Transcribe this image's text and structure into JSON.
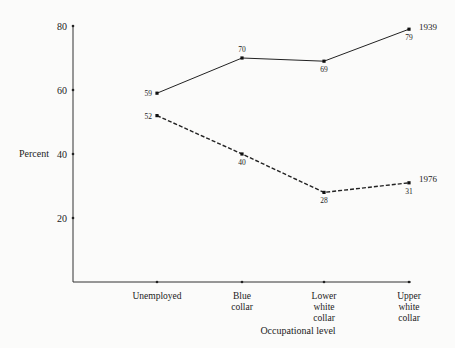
{
  "chart_data": {
    "type": "line",
    "title": "",
    "xlabel": "Occupational level",
    "ylabel": "Percent",
    "categories": [
      "Unemployed",
      "Blue collar",
      "Lower white collar",
      "Upper white collar"
    ],
    "category_lines": [
      [
        "Unemployed"
      ],
      [
        "Blue",
        "collar"
      ],
      [
        "Lower",
        "white",
        "collar"
      ],
      [
        "Upper",
        "white",
        "collar"
      ]
    ],
    "yticks": [
      20,
      40,
      60,
      80
    ],
    "ylim": [
      0,
      80
    ],
    "grid": false,
    "legend": "inline labels at line ends",
    "series": [
      {
        "name": "1939",
        "values": [
          59,
          70,
          69,
          79
        ],
        "style": "solid",
        "color": "#222222"
      },
      {
        "name": "1976",
        "values": [
          52,
          40,
          28,
          31
        ],
        "style": "dashed",
        "color": "#222222"
      }
    ]
  }
}
